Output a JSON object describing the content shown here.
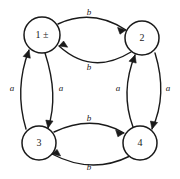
{
  "diagram": {
    "kind": "state-transition-diagram",
    "title": "",
    "canvas": {
      "width": 180,
      "height": 179,
      "background": "#ffffff"
    },
    "stroke_color": "#1a1a1a",
    "nodes": [
      {
        "id": "n1",
        "label": "1 ±",
        "cx": 42,
        "cy": 35,
        "r": 18
      },
      {
        "id": "n2",
        "label": "2",
        "cx": 142,
        "cy": 38,
        "r": 17
      },
      {
        "id": "n3",
        "label": "3",
        "cx": 39,
        "cy": 143,
        "r": 17
      },
      {
        "id": "n4",
        "label": "4",
        "cx": 140,
        "cy": 143,
        "r": 17
      }
    ],
    "edges": [
      {
        "id": "e-1-2",
        "from": "n1",
        "to": "n2",
        "label": "b",
        "label_x": 89,
        "label_y": 13,
        "side": "top-outer"
      },
      {
        "id": "e-2-1",
        "from": "n2",
        "to": "n1",
        "label": "b",
        "label_x": 89,
        "label_y": 68,
        "side": "top-inner"
      },
      {
        "id": "e-3-1",
        "from": "n3",
        "to": "n1",
        "label": "a",
        "label_x": 12,
        "label_y": 89,
        "side": "left-outer"
      },
      {
        "id": "e-1-3",
        "from": "n1",
        "to": "n3",
        "label": "a",
        "label_x": 61,
        "label_y": 89,
        "side": "left-inner"
      },
      {
        "id": "e-4-2",
        "from": "n4",
        "to": "n2",
        "label": "a",
        "label_x": 118,
        "label_y": 89,
        "side": "right-inner"
      },
      {
        "id": "e-2-4",
        "from": "n2",
        "to": "n4",
        "label": "a",
        "label_x": 168,
        "label_y": 89,
        "side": "right-outer"
      },
      {
        "id": "e-3-4",
        "from": "n3",
        "to": "n4",
        "label": "b",
        "label_x": 89,
        "label_y": 119,
        "side": "bottom-inner"
      },
      {
        "id": "e-4-3",
        "from": "n4",
        "to": "n3",
        "label": "b",
        "label_x": 89,
        "label_y": 168,
        "side": "bottom-outer"
      }
    ],
    "alphabet": [
      "a",
      "b"
    ],
    "node_labels": [
      "1 ±",
      "2",
      "3",
      "4"
    ]
  }
}
